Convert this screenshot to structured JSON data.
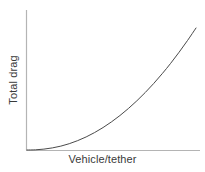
{
  "chart_data": {
    "type": "line",
    "title": "",
    "subtitle": "",
    "xlabel": "Vehicle/tether",
    "ylabel": "Total drag",
    "grid": false,
    "legend": null,
    "annotations": [],
    "axis": {
      "x_tick_labels": [],
      "y_tick_labels": [],
      "xlim": [
        0,
        1
      ],
      "ylim": [
        0,
        1
      ],
      "x_axis_color": "#b4b4b4",
      "y_axis_color": "#b4b4b4",
      "arrowheads": false
    },
    "series": [
      {
        "name": "total drag",
        "color": "#4a4a4a",
        "line_width": 1,
        "x": [
          0.0,
          0.05,
          0.1,
          0.15,
          0.2,
          0.25,
          0.3,
          0.35,
          0.4,
          0.45,
          0.5,
          0.55,
          0.6,
          0.65,
          0.7,
          0.75,
          0.8,
          0.85,
          0.9,
          0.95,
          1.0
        ],
        "y": [
          0.0,
          0.002,
          0.01,
          0.024,
          0.044,
          0.072,
          0.107,
          0.149,
          0.199,
          0.256,
          0.321,
          0.393,
          0.473,
          0.561,
          0.656,
          0.759,
          0.87,
          0.988,
          1.115,
          1.249,
          1.391
        ]
      }
    ]
  },
  "labels": {
    "x": "Vehicle/tether",
    "y": "Total drag"
  },
  "colors": {
    "background": "#ffffff",
    "axis": "#b4b4b4",
    "curve": "#4a4a4a",
    "text": "#3a3a3a"
  }
}
